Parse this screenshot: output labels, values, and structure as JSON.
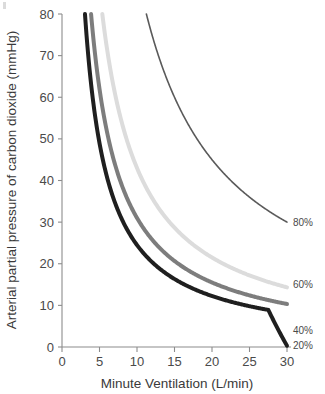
{
  "chart_data": {
    "type": "line",
    "title": "",
    "subtitle": "",
    "xlabel": "Minute Ventilation (L/min)",
    "ylabel": "Arterial partial pressure of carbon dioxide (mmHg)",
    "xlim": [
      0,
      30
    ],
    "ylim": [
      0,
      80
    ],
    "xticks": [
      0,
      5,
      10,
      15,
      20,
      25,
      30
    ],
    "yticks": [
      0,
      10,
      20,
      30,
      40,
      50,
      60,
      70,
      80
    ],
    "xtick_labels": [
      "0",
      "5",
      "10",
      "15",
      "20",
      "25",
      "30"
    ],
    "ytick_labels": [
      "0",
      "10",
      "20",
      "30",
      "40",
      "50",
      "60",
      "70",
      "80"
    ],
    "grid": false,
    "legend_position": "curve-end-right",
    "annotation_note": "Each curve is a rectangular hyperbola PaCO2 = k / minute ventilation; labels give the dead space / shunt fraction at the right end of each curve.",
    "series": [
      {
        "name": "20%",
        "label": "20%",
        "color": "#1f1f1f",
        "stroke_width": 4.0,
        "k": 245,
        "x": [
          3.06,
          3.5,
          4,
          4.5,
          5,
          6,
          7,
          8,
          9,
          10,
          11,
          12,
          13,
          14,
          15,
          16,
          17,
          18,
          20,
          22,
          24,
          26,
          28,
          30
        ],
        "values": [
          80,
          70,
          61.3,
          54.4,
          49,
          40.8,
          35,
          30.6,
          27.2,
          24.5,
          22.3,
          20.4,
          18.8,
          17.5,
          16.3,
          15.3,
          14.4,
          13.6,
          12.3,
          11.1,
          10.2,
          9.4,
          8.8,
          8.2
        ],
        "endpoint": [
          30,
          0.3
        ]
      },
      {
        "name": "40%",
        "label": "40%",
        "color": "#7d7d7d",
        "stroke_width": 4.0,
        "k": 310,
        "x": [
          3.88,
          4.5,
          5,
          6,
          7,
          8,
          9,
          10,
          11,
          12,
          13,
          14,
          15,
          16,
          17,
          18,
          20,
          22,
          24,
          26,
          28,
          30
        ],
        "values": [
          80,
          68.9,
          62,
          51.7,
          44.3,
          38.8,
          34.4,
          31,
          28.2,
          25.8,
          23.8,
          22.1,
          20.7,
          19.4,
          18.2,
          17.2,
          15.5,
          14.1,
          12.9,
          11.9,
          11.1,
          10.3
        ],
        "endpoint": [
          30,
          4
        ]
      },
      {
        "name": "60%",
        "label": "60%",
        "color": "#dcdcdc",
        "stroke_width": 4.0,
        "k": 430,
        "x": [
          5.38,
          6,
          7,
          8,
          9,
          10,
          11,
          12,
          13,
          14,
          15,
          16,
          17,
          18,
          20,
          22,
          24,
          26,
          28,
          30
        ],
        "values": [
          80,
          71.7,
          61.4,
          53.8,
          47.8,
          43,
          39.1,
          35.8,
          33.1,
          30.7,
          28.7,
          26.9,
          25.3,
          23.9,
          21.5,
          19.5,
          17.9,
          16.5,
          15.4,
          14.3
        ],
        "endpoint": [
          30,
          15
        ]
      },
      {
        "name": "80%",
        "label": "80%",
        "color": "#5a5a5a",
        "stroke_width": 1.6,
        "k": 900,
        "x": [
          11.25,
          12,
          13,
          14,
          15,
          16,
          17,
          18,
          19,
          20,
          21,
          22,
          23,
          24,
          25,
          26,
          27,
          28,
          29,
          30
        ],
        "values": [
          80,
          75,
          69.2,
          64.3,
          60,
          56.3,
          52.9,
          50,
          47.4,
          45,
          42.9,
          40.9,
          39.1,
          37.5,
          36,
          34.6,
          33.3,
          32.1,
          31,
          30
        ],
        "endpoint": [
          30,
          30
        ]
      }
    ]
  },
  "axes": {
    "x_title": "Minute Ventilation (L/min)",
    "y_title": "Arterial partial pressure of carbon dioxide (mmHg)"
  },
  "colors": {
    "axis": "#8c8c8c",
    "text": "#3a3a3a",
    "background": "#ffffff"
  }
}
